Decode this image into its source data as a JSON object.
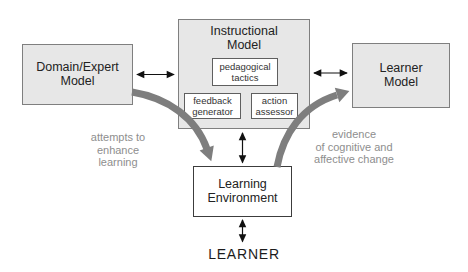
{
  "diagram": {
    "domain_model": {
      "line1": "Domain/Expert",
      "line2": "Model"
    },
    "instructional_model": {
      "line1": "Instructional",
      "line2": "Model",
      "pedagogical_tactics": {
        "line1": "pedagogical",
        "line2": "tactics"
      },
      "feedback_generator": {
        "line1": "feedback",
        "line2": "generator"
      },
      "action_assessor": {
        "line1": "action",
        "line2": "assessor"
      }
    },
    "learner_model": {
      "line1": "Learner",
      "line2": "Model"
    },
    "learning_environment": {
      "line1": "Learning",
      "line2": "Environment"
    },
    "learner_label": "LEARNER",
    "left_annotation": {
      "line1": "attempts to",
      "line2": "enhance",
      "line3": "learning"
    },
    "right_annotation": {
      "line1": "evidence",
      "line2": "of cognitive and",
      "line3": "affective change"
    },
    "colors": {
      "background": "#ffffff",
      "box_fill": "#e7e7e7",
      "box_border": "#7f7f7f",
      "inner_box_border": "#5f5f5f",
      "environment_border": "#3c3c3c",
      "thick_arrow": "#7e7e7e",
      "thin_arrow": "#111111",
      "annotation_text": "#8e8e8e",
      "label_text": "#1f1f1f"
    }
  }
}
